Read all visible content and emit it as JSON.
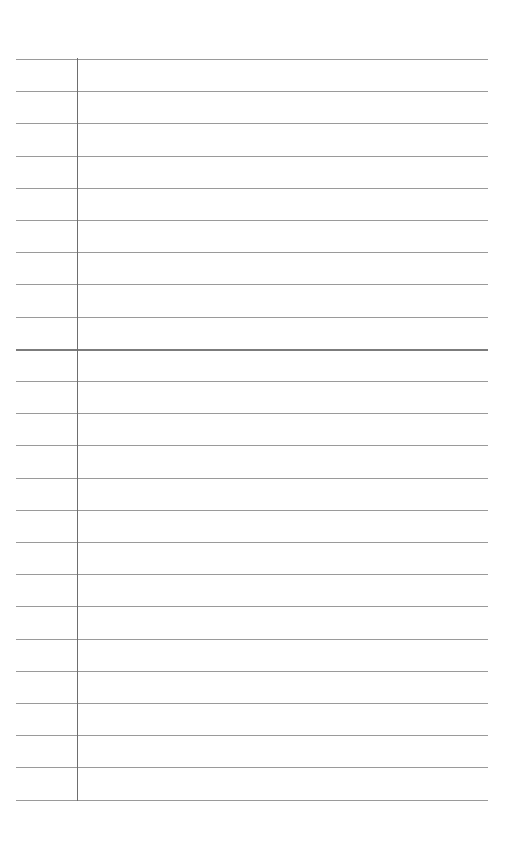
{
  "document": {
    "type": "lined-paper",
    "rule_count": 24,
    "first_rule_y": 59,
    "rule_spacing": 32.2,
    "rule_left": 16,
    "rule_right": 488,
    "margin_line_x": 77,
    "strong_rule_index": 9,
    "colors": {
      "background": "#ffffff",
      "rule": "#9a9a9a",
      "margin_line": "#6e6e6e"
    }
  }
}
